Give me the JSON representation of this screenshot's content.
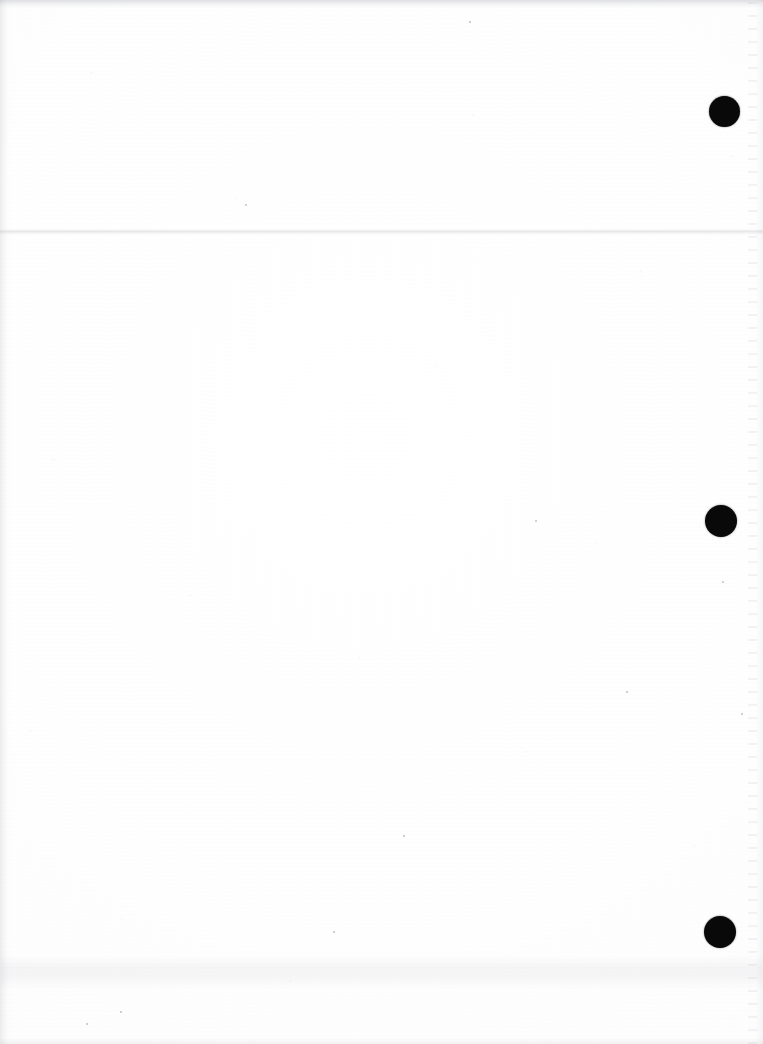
{
  "document": {
    "kind": "scanned-page",
    "title": "",
    "visible_text": "",
    "page_width": 763,
    "page_height": 1044,
    "background_color": "#fefefe",
    "ink_color": "#090909",
    "note": ""
  },
  "marks": {
    "label": "",
    "dots": [
      {
        "name": "register-dot-top",
        "cx": 724,
        "cy": 111,
        "d": 31,
        "color": "#090909"
      },
      {
        "name": "register-dot-middle",
        "cx": 721,
        "cy": 521,
        "d": 32,
        "color": "#090909"
      },
      {
        "name": "register-dot-bottom",
        "cx": 720,
        "cy": 932,
        "d": 32,
        "color": "#090909"
      }
    ]
  },
  "artifacts": {
    "scan_streak_y": 229,
    "smudge_band_y": 955,
    "speckle_column_x": 748,
    "specks": [
      {
        "x": 121,
        "y": 1012,
        "r": 1.2
      },
      {
        "x": 723,
        "y": 582,
        "r": 1.1
      },
      {
        "x": 742,
        "y": 714,
        "r": 1.0
      },
      {
        "x": 246,
        "y": 205,
        "r": 1.1
      },
      {
        "x": 470,
        "y": 22,
        "r": 0.9
      },
      {
        "x": 87,
        "y": 1024,
        "r": 1.0
      },
      {
        "x": 404,
        "y": 836,
        "r": 0.9
      },
      {
        "x": 536,
        "y": 521,
        "r": 1.0
      },
      {
        "x": 627,
        "y": 692,
        "r": 0.9
      },
      {
        "x": 334,
        "y": 932,
        "r": 0.9
      }
    ]
  }
}
